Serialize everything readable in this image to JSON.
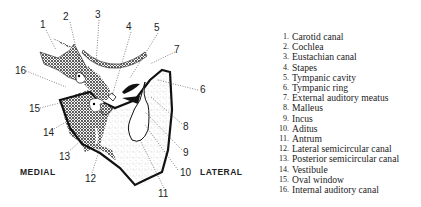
{
  "diagram": {
    "orientation": {
      "left": "MEDIAL",
      "right": "LATERAL"
    },
    "callouts": [
      {
        "n": "1",
        "x": 40,
        "y": 20
      },
      {
        "n": "2",
        "x": 63,
        "y": 12
      },
      {
        "n": "3",
        "x": 95,
        "y": 10
      },
      {
        "n": "4",
        "x": 126,
        "y": 22
      },
      {
        "n": "5",
        "x": 154,
        "y": 23
      },
      {
        "n": "6",
        "x": 200,
        "y": 85
      },
      {
        "n": "7",
        "x": 174,
        "y": 45
      },
      {
        "n": "8",
        "x": 183,
        "y": 122
      },
      {
        "n": "9",
        "x": 183,
        "y": 148
      },
      {
        "n": "10",
        "x": 180,
        "y": 168
      },
      {
        "n": "11",
        "x": 158,
        "y": 189
      },
      {
        "n": "12",
        "x": 85,
        "y": 174
      },
      {
        "n": "13",
        "x": 59,
        "y": 152
      },
      {
        "n": "14",
        "x": 43,
        "y": 128
      },
      {
        "n": "15",
        "x": 29,
        "y": 104
      },
      {
        "n": "16",
        "x": 15,
        "y": 66
      }
    ]
  },
  "legend": [
    {
      "n": "1.",
      "label": "Carotid canal"
    },
    {
      "n": "2.",
      "label": "Cochlea"
    },
    {
      "n": "3.",
      "label": "Eustachian canal"
    },
    {
      "n": "4.",
      "label": "Stapes"
    },
    {
      "n": "5.",
      "label": "Tympanic cavity"
    },
    {
      "n": "6.",
      "label": "Tympanic ring"
    },
    {
      "n": "7.",
      "label": "External auditory meatus"
    },
    {
      "n": "8.",
      "label": "Malleus"
    },
    {
      "n": "9.",
      "label": "Incus"
    },
    {
      "n": "10.",
      "label": "Aditus"
    },
    {
      "n": "11.",
      "label": "Antrum"
    },
    {
      "n": "12.",
      "label": "Lateral semicircular canal"
    },
    {
      "n": "13.",
      "label": "Posterior semicircular canal"
    },
    {
      "n": "14.",
      "label": "Vestibule"
    },
    {
      "n": "15.",
      "label": "Oval window"
    },
    {
      "n": "16.",
      "label": "Internal auditory canal"
    }
  ]
}
